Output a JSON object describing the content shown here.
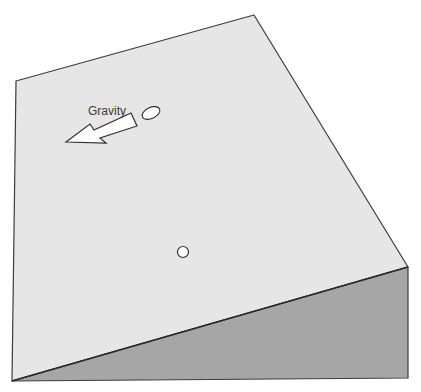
{
  "diagram": {
    "labels": {
      "gravity": "Gravity"
    },
    "colors": {
      "top_face": "#e6e6e6",
      "side_face": "#a6a6a6",
      "edge": "#3c3c3c",
      "arrow_fill": "#ffffff",
      "ball_fill": "#ffffff"
    },
    "objects": [
      {
        "name": "gravity-arrow",
        "direction": "down-left"
      },
      {
        "name": "ellipse-ball",
        "shape": "ellipse"
      },
      {
        "name": "circle-ball",
        "shape": "circle"
      }
    ]
  }
}
